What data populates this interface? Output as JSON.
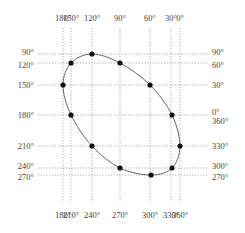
{
  "diagram": {
    "type": "lissajous-ellipse",
    "top_labels": [
      {
        "text": "180°",
        "x": 63
      },
      {
        "text": "150°",
        "x": 71
      },
      {
        "text": "120°",
        "x": 92
      },
      {
        "text": "90°",
        "x": 120
      },
      {
        "text": "60°",
        "x": 150
      },
      {
        "text": "30°",
        "x": 171
      },
      {
        "text": "0°",
        "x": 180
      }
    ],
    "bottom_labels": [
      {
        "text": "180°",
        "x": 63
      },
      {
        "text": "210°",
        "x": 71
      },
      {
        "text": "240°",
        "x": 92
      },
      {
        "text": "270°",
        "x": 120
      },
      {
        "text": "300°",
        "x": 150
      },
      {
        "text": "330°",
        "x": 171
      },
      {
        "text": "360°",
        "x": 180
      }
    ],
    "left_labels": [
      {
        "text": "90°",
        "y": 54
      },
      {
        "text": "120°",
        "y": 63
      },
      {
        "text": "150°",
        "y": 85
      },
      {
        "text": "180°",
        "y": 115
      },
      {
        "text": "210°",
        "y": 146
      },
      {
        "text": "240°",
        "y": 168
      },
      {
        "text": "270°",
        "y": 175
      }
    ],
    "right_labels": [
      {
        "text": "90°",
        "y": 54
      },
      {
        "text": "60°",
        "y": 63
      },
      {
        "text": "30°",
        "y": 85
      },
      {
        "text": "0°",
        "y": 112
      },
      {
        "text": "360°",
        "y": 121
      },
      {
        "text": "330°",
        "y": 146
      },
      {
        "text": "300°",
        "y": 168
      },
      {
        "text": "270°",
        "y": 175
      }
    ],
    "points": [
      {
        "x": 92,
        "y": 54
      },
      {
        "x": 71,
        "y": 63
      },
      {
        "x": 63,
        "y": 85
      },
      {
        "x": 71,
        "y": 115
      },
      {
        "x": 92,
        "y": 146
      },
      {
        "x": 120,
        "y": 168
      },
      {
        "x": 151,
        "y": 175
      },
      {
        "x": 172,
        "y": 168
      },
      {
        "x": 180,
        "y": 146
      },
      {
        "x": 172,
        "y": 115
      },
      {
        "x": 150,
        "y": 85
      },
      {
        "x": 120,
        "y": 63
      }
    ]
  }
}
